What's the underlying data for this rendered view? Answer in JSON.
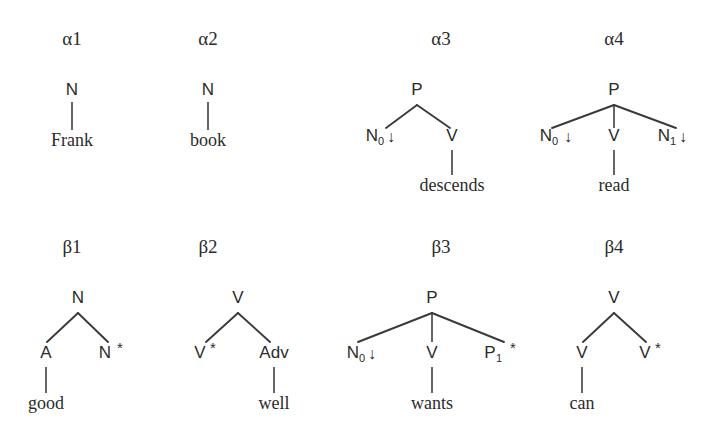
{
  "figure": {
    "background_color": "#ffffff",
    "ink_color": "#2b2b2b",
    "line_color": "#3a3a3a"
  },
  "trees": [
    {
      "id": "alpha1",
      "name": "α1",
      "root": "N",
      "children": [
        "Frank"
      ],
      "anchor": "Frank",
      "type": "initial",
      "name_x": 72,
      "name_y": 45,
      "root_x": 72,
      "root_y": 95,
      "terminal_x": 72,
      "terminal_y": 146
    },
    {
      "id": "alpha2",
      "name": "α2",
      "root": "N",
      "children": [
        "book"
      ],
      "anchor": "book",
      "type": "initial",
      "name_x": 208,
      "name_y": 45,
      "root_x": 208,
      "root_y": 95,
      "terminal_x": 208,
      "terminal_y": 146
    },
    {
      "id": "alpha3",
      "name": "α3",
      "root": "P",
      "children": [
        "N₀↓",
        "V"
      ],
      "anchor": "descends",
      "type": "initial",
      "name_x": 441,
      "name_y": 45,
      "root_x": 417,
      "root_y": 95,
      "left_x": 382,
      "left_y": 141,
      "right_x": 452,
      "right_y": 141,
      "terminal_x": 452,
      "terminal_y": 191
    },
    {
      "id": "alpha4",
      "name": "α4",
      "root": "P",
      "children": [
        "N₀↓",
        "V",
        "N₁↓"
      ],
      "anchor": "read",
      "type": "initial",
      "name_x": 614,
      "name_y": 45,
      "root_x": 614,
      "root_y": 95,
      "left_x": 556,
      "left_y": 141,
      "mid_x": 614,
      "mid_y": 141,
      "right_x": 672,
      "right_y": 141,
      "terminal_x": 614,
      "terminal_y": 191
    },
    {
      "id": "beta1",
      "name": "β1",
      "root": "N",
      "children": [
        "A",
        "N*"
      ],
      "anchor": "good",
      "type": "auxiliary",
      "foot": "N*",
      "name_x": 72,
      "name_y": 253,
      "root_x": 78,
      "root_y": 303,
      "left_x": 46,
      "left_y": 358,
      "right_x": 106,
      "right_y": 358,
      "terminal_x": 46,
      "terminal_y": 409
    },
    {
      "id": "beta2",
      "name": "β2",
      "root": "V",
      "children": [
        "V*",
        "Adv"
      ],
      "anchor": "well",
      "type": "auxiliary",
      "foot": "V*",
      "name_x": 208,
      "name_y": 253,
      "root_x": 238,
      "root_y": 303,
      "left_x": 204,
      "left_y": 358,
      "right_x": 274,
      "right_y": 358,
      "terminal_x": 274,
      "terminal_y": 409
    },
    {
      "id": "beta3",
      "name": "β3",
      "root": "P",
      "children": [
        "N₀↓",
        "V",
        "P₁ *"
      ],
      "anchor": "wants",
      "type": "auxiliary",
      "foot": "P₁ *",
      "name_x": 441,
      "name_y": 253,
      "root_x": 432,
      "root_y": 303,
      "left_x": 363,
      "left_y": 358,
      "mid_x": 432,
      "mid_y": 358,
      "right_x": 500,
      "right_y": 358,
      "terminal_x": 432,
      "terminal_y": 409
    },
    {
      "id": "beta4",
      "name": "β4",
      "root": "V",
      "children": [
        "V",
        "V*"
      ],
      "anchor": "can",
      "type": "auxiliary",
      "foot": "V*",
      "name_x": 614,
      "name_y": 253,
      "root_x": 614,
      "root_y": 303,
      "left_x": 582,
      "left_y": 358,
      "right_x": 648,
      "right_y": 358,
      "terminal_x": 582,
      "terminal_y": 409
    }
  ],
  "labels": {
    "N": "N",
    "V": "V",
    "P": "P",
    "A": "A",
    "Adv": "Adv",
    "sub_0": "0",
    "sub_1": "1",
    "down_arrow": "↓",
    "star": "*"
  },
  "terminals": {
    "frank": "Frank",
    "book": "book",
    "descends": "descends",
    "read": "read",
    "good": "good",
    "well": "well",
    "wants": "wants",
    "can": "can"
  }
}
